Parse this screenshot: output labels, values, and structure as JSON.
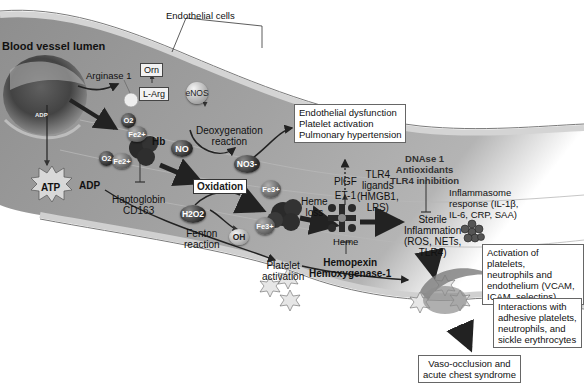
{
  "diagram": {
    "type": "biological pathway illustration",
    "topic": "Hemolysis-driven pathophysiology in blood vessel (sickle cell disease)"
  },
  "labels": {
    "vessel_lumen": "Blood vessel lumen",
    "endothelial_cells": "Endothelial cells",
    "arginase": "Arginase 1",
    "orn": "Orn",
    "l_arg": "L-Arg",
    "enos": "eNOS",
    "o2_top": "O2",
    "fe_top": "Fe2+",
    "hb": "Hb",
    "o2_left": "O2",
    "fe_left": "Fe2+",
    "adp_small": "ADP",
    "atp": "ATP",
    "adp": "ADP",
    "haptoglobin": "Haptoglobin",
    "cd163": "CD163",
    "no": "NO",
    "deoxygenation_1": "Deoxygenation",
    "deoxygenation_2": "reaction",
    "no3": "NO3-",
    "oxidation": "Oxidation",
    "h2o2": "H2O2",
    "fenton_1": "Fenton",
    "fenton_2": "reaction",
    "oh": "OH",
    "fe3_top": "Fe3+",
    "fe3_bottom": "Fe3+",
    "heme_loss_1": "Heme",
    "heme_loss_2": "loss",
    "heme": "Heme",
    "hemopexin": "Hemopexin",
    "hemoxygenase": "Hemoxygenase-1",
    "plgf": "PlGF",
    "et1": "ET-1",
    "tlr4_1": "TLR4",
    "tlr4_2": "ligands",
    "tlr4_3": "(HMGB1,",
    "tlr4_4": "LPS)",
    "dnase": "DNAse 1",
    "antioxidants": "Antioxidants",
    "tlr4_inhibition": "TLR4 inhibition",
    "sterile_1": "Sterile",
    "sterile_2": "Inflammation",
    "sterile_3": "(ROS, NETs,",
    "sterile_4": "TLR4)",
    "inflammasome_1": "Inflammasome",
    "inflammasome_2": "response (IL-1β,",
    "inflammasome_3": "IL-6, CRP, SAA)",
    "platelet_act_1": "Platelet",
    "platelet_act_2": "activation"
  },
  "boxes": {
    "endothelial_dysfunction": [
      "Endothelial dysfunction",
      "Platelet activation",
      "Pulmonary hypertension"
    ],
    "activation": [
      "Activation of platelets,",
      "neutrophils and",
      "endothelium (VCAM,",
      "ICAM, selectins)"
    ],
    "interactions": [
      "Interactions with",
      "adhesive platelets,",
      "neutrophils, and",
      "sickle erythrocytes"
    ],
    "vaso_occlusion": [
      "Vaso-occlusion and",
      "acute chest syndrome"
    ]
  },
  "colors": {
    "vessel_fill": "#9a9a9a",
    "vessel_dark": "#6e6e6e",
    "endothelium": "#c8c8c8",
    "arrow": "#2b2b2b"
  }
}
